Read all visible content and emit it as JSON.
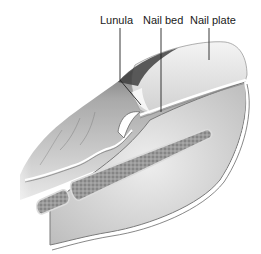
{
  "diagram": {
    "labels": [
      {
        "id": "lunula",
        "text": "Lunula"
      },
      {
        "id": "nail-bed",
        "text": "Nail bed"
      },
      {
        "id": "nail-plate",
        "text": "Nail plate"
      }
    ],
    "colors": {
      "background": "#ffffff",
      "skin_dark": "#6e6e6e",
      "skin_mid": "#b5b5b5",
      "skin_light": "#e6e6e6",
      "tissue": "#d9d9d9",
      "bone": "#8c8c8c",
      "nail_plate": "#efefef",
      "leader_line": "#222222"
    }
  }
}
